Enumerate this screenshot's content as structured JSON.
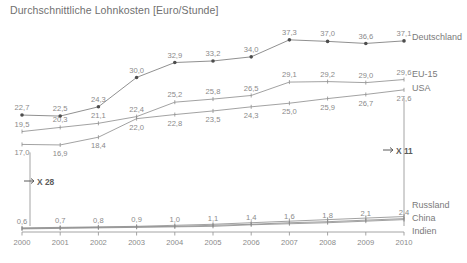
{
  "chart_data": {
    "type": "line",
    "title": "Durchschnittliche Lohnkosten [Euro/Stunde]",
    "xlabel": "",
    "ylabel": "",
    "grid": false,
    "legend_position": "right",
    "categories": [
      "2000",
      "2001",
      "2002",
      "2003",
      "2004",
      "2005",
      "2006",
      "2007",
      "2008",
      "2009",
      "2010"
    ],
    "x": [
      2000,
      2001,
      2002,
      2003,
      2004,
      2005,
      2006,
      2007,
      2008,
      2009,
      2010
    ],
    "ylim": [
      0,
      40
    ],
    "series": [
      {
        "name": "Deutschland",
        "values": [
          22.7,
          22.5,
          24.3,
          30.0,
          32.9,
          33.2,
          34.0,
          37.3,
          37.0,
          36.6,
          37.1
        ],
        "labels": [
          "22,7",
          "22,5",
          "24,3",
          "30,0",
          "32,9",
          "33,2",
          "34,0",
          "37,3",
          "37,0",
          "36,6",
          "37,1"
        ],
        "marker": "filled-circle"
      },
      {
        "name": "EU-15",
        "values": [
          19.5,
          20.3,
          21.1,
          22.4,
          25.2,
          25.8,
          26.5,
          29.1,
          29.2,
          29.0,
          29.6
        ],
        "labels": [
          "19,5",
          "20,3",
          "21,1",
          "22,4",
          "25,2",
          "25,8",
          "26,5",
          "29,1",
          "29,2",
          "29,0",
          "29,6"
        ],
        "marker": "tick"
      },
      {
        "name": "USA",
        "values": [
          17.0,
          16.9,
          18.4,
          22.0,
          22.8,
          23.5,
          24.3,
          25.0,
          25.9,
          26.7,
          27.6
        ],
        "labels": [
          "17,0",
          "16,9",
          "18,4",
          "22,0",
          "22,8",
          "23,5",
          "24,3",
          "25,0",
          "25,9",
          "26,7",
          "27,6"
        ],
        "marker": "tick"
      },
      {
        "name": "Russland",
        "values": [
          0.8,
          0.9,
          1.0,
          1.1,
          1.3,
          1.5,
          1.8,
          2.1,
          2.4,
          2.7,
          3.0
        ],
        "labels": [],
        "marker": "tick"
      },
      {
        "name": "China",
        "values": [
          0.7,
          0.8,
          0.9,
          1.0,
          1.1,
          1.3,
          1.5,
          1.8,
          2.0,
          2.3,
          2.6
        ],
        "labels": [],
        "marker": "tick"
      },
      {
        "name": "Indien",
        "values": [
          0.6,
          0.7,
          0.8,
          0.9,
          1.0,
          1.1,
          1.4,
          1.6,
          1.8,
          2.1,
          2.4
        ],
        "labels": [
          "0,6",
          "0,7",
          "0,8",
          "0,9",
          "1,0",
          "1,1",
          "1,4",
          "1,6",
          "1,8",
          "2,1",
          "2,4"
        ],
        "marker": "tick"
      }
    ],
    "annotations": [
      {
        "text": "X 28",
        "kind": "bracket-left"
      },
      {
        "text": "X 11",
        "kind": "bracket-right"
      }
    ]
  },
  "labels": {
    "title": "Durchschnittliche Lohnkosten [Euro/Stunde]",
    "series_deutschland": "Deutschland",
    "series_eu15": "EU-15",
    "series_usa": "USA",
    "series_russland": "Russland",
    "series_china": "China",
    "series_indien": "Indien",
    "annot_x28": "X 28",
    "annot_x11": "X 11",
    "tick_2000": "2000",
    "tick_2001": "2001",
    "tick_2002": "2002",
    "tick_2003": "2003",
    "tick_2004": "2004",
    "tick_2005": "2005",
    "tick_2006": "2006",
    "tick_2007": "2007",
    "tick_2008": "2008",
    "tick_2009": "2009",
    "tick_2010": "2010"
  },
  "colors": {
    "line": "#8a8a8a",
    "text": "#8a8a8a",
    "title": "#707070",
    "axis": "#9a9a9a",
    "annotation": "#5b5b5b",
    "background": "#ffffff"
  }
}
